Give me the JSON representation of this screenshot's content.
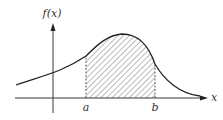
{
  "diagram": {
    "y_axis_label": "f(x)",
    "x_axis_label": "x",
    "lower_bound_label": "a",
    "upper_bound_label": "b",
    "region": "area under curve between a and b, hatched",
    "colors": {
      "stroke": "#222222",
      "hatch": "#555555",
      "background": "#ffffff"
    }
  }
}
